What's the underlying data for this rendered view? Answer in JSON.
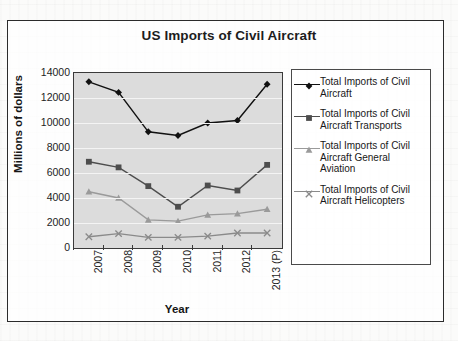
{
  "chart_data": {
    "type": "line",
    "title": "US Imports of Civil Aircraft",
    "xlabel": "Year",
    "ylabel": "Millions of dollars",
    "categories": [
      "2007",
      "2008",
      "2009",
      "2010",
      "2011",
      "2012",
      "2013 (P)"
    ],
    "ylim": [
      0,
      14000
    ],
    "ytick_labels": [
      "14000",
      "12000",
      "10000",
      "8000",
      "6000",
      "4000",
      "2000",
      "0"
    ],
    "yticks": [
      14000,
      12000,
      10000,
      8000,
      6000,
      4000,
      2000,
      0
    ],
    "grid": true,
    "legend_position": "right",
    "plot_background": "#dcdcdc",
    "series": [
      {
        "name": "Total Imports of Civil Aircraft",
        "marker": "diamond",
        "color": "#111111",
        "values": [
          13300,
          12450,
          9300,
          9000,
          10000,
          10200,
          13100
        ]
      },
      {
        "name": "Total Imports of Civil Aircraft Transports",
        "marker": "square",
        "color": "#4d4d4d",
        "values": [
          6900,
          6450,
          4950,
          3300,
          5000,
          4600,
          6650
        ]
      },
      {
        "name": "Total Imports of Civil Aircraft General Aviation",
        "marker": "triangle",
        "color": "#9a9a9a",
        "values": [
          4500,
          4000,
          2250,
          2150,
          2650,
          2750,
          3100
        ]
      },
      {
        "name": "Total Imports of Civil Aircraft Helicopters",
        "marker": "cross",
        "color": "#8a8a8a",
        "values": [
          900,
          1150,
          850,
          850,
          950,
          1200,
          1200
        ]
      }
    ]
  },
  "legend": {
    "entries": [
      "Total Imports of Civil Aircraft",
      "Total Imports of Civil Aircraft Transports",
      "Total Imports of Civil Aircraft General Aviation",
      "Total Imports of Civil Aircraft Helicopters"
    ]
  }
}
